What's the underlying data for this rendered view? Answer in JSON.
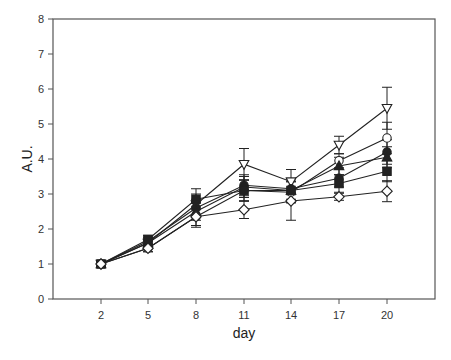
{
  "chart_data": {
    "type": "line",
    "title": "",
    "xlabel": "day",
    "ylabel": "A.U.",
    "x": [
      2,
      5,
      8,
      11,
      14,
      17,
      20
    ],
    "xticks": [
      "2",
      "5",
      "8",
      "11",
      "14",
      "17",
      "20"
    ],
    "yticks": [
      "0",
      "1",
      "2",
      "3",
      "4",
      "5",
      "6",
      "7",
      "8"
    ],
    "ylim": [
      0,
      8
    ],
    "xlim": [
      -1,
      23
    ],
    "grid": false,
    "legend": "none",
    "series": [
      {
        "name": "open-triangle-down",
        "marker": "triangle-down",
        "filled": false,
        "values": [
          1.0,
          1.6,
          2.7,
          3.85,
          3.35,
          4.4,
          5.45
        ],
        "errors": [
          0.08,
          0.15,
          0.3,
          0.45,
          0.35,
          0.25,
          0.6
        ]
      },
      {
        "name": "open-circle",
        "marker": "circle",
        "filled": false,
        "values": [
          1.0,
          1.45,
          2.35,
          3.1,
          3.05,
          3.95,
          4.6
        ],
        "errors": [
          0.08,
          0.1,
          0.25,
          0.3,
          0.3,
          0.2,
          0.45
        ]
      },
      {
        "name": "filled-circle",
        "marker": "circle",
        "filled": true,
        "values": [
          1.0,
          1.65,
          2.6,
          3.25,
          3.15,
          3.45,
          4.2
        ],
        "errors": [
          0.08,
          0.12,
          0.25,
          0.3,
          0.3,
          0.25,
          0.35
        ]
      },
      {
        "name": "filled-triangle-up",
        "marker": "triangle-up",
        "filled": true,
        "values": [
          1.0,
          1.6,
          2.5,
          3.2,
          3.1,
          3.8,
          4.05
        ],
        "errors": [
          0.08,
          0.12,
          0.25,
          0.3,
          0.3,
          0.25,
          0.3
        ]
      },
      {
        "name": "filled-square",
        "marker": "square",
        "filled": true,
        "values": [
          1.0,
          1.7,
          2.85,
          3.1,
          3.1,
          3.3,
          3.65
        ],
        "errors": [
          0.08,
          0.12,
          0.3,
          0.3,
          0.35,
          0.25,
          0.3
        ]
      },
      {
        "name": "open-diamond",
        "marker": "diamond",
        "filled": false,
        "values": [
          1.0,
          1.45,
          2.35,
          2.55,
          2.8,
          2.92,
          3.08
        ],
        "errors": [
          0.08,
          0.1,
          0.3,
          0.25,
          0.55,
          0.1,
          0.3
        ]
      }
    ]
  },
  "layout": {
    "plot_left": 53,
    "plot_right": 435,
    "plot_top": 19,
    "plot_bottom": 299,
    "x_positions": [
      101,
      148,
      196,
      244,
      291,
      339,
      387
    ],
    "line_color": "#222222",
    "frame_color": "#555555"
  }
}
